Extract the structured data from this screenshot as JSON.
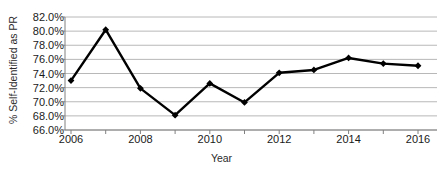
{
  "top_fragment": "",
  "chart_data": {
    "type": "line",
    "title": "",
    "xlabel": "Year",
    "ylabel": "% Self-Identified as PR",
    "x": [
      2006,
      2007,
      2008,
      2009,
      2010,
      2011,
      2012,
      2013,
      2014,
      2015,
      2016
    ],
    "values": [
      73.0,
      80.2,
      71.9,
      68.1,
      72.6,
      69.9,
      74.1,
      74.5,
      76.2,
      75.4,
      75.1
    ],
    "y_tick_labels": [
      "82.0%",
      "80.0%",
      "78.0%",
      "76.0%",
      "74.0%",
      "72.0%",
      "70.0%",
      "68.0%",
      "66.0%"
    ],
    "y_tick_values": [
      82.0,
      80.0,
      78.0,
      76.0,
      74.0,
      72.0,
      70.0,
      68.0,
      66.0
    ],
    "x_tick_values": [
      2006,
      2007,
      2008,
      2009,
      2010,
      2011,
      2012,
      2013,
      2014,
      2015,
      2016
    ],
    "x_tick_labels_shown": [
      "2006",
      "2008",
      "2010",
      "2012",
      "2014",
      "2016"
    ],
    "x_tick_labels_shown_values": [
      2006,
      2008,
      2010,
      2012,
      2014,
      2016
    ],
    "ylim": [
      66.0,
      82.0
    ],
    "xlim": [
      2006,
      2016
    ],
    "grid": true,
    "grid_orientation": "horizontal",
    "legend": false,
    "series_color": "#000000",
    "grid_color": "#b0b0b0",
    "axis_color": "#808080",
    "marker": "diamond"
  }
}
